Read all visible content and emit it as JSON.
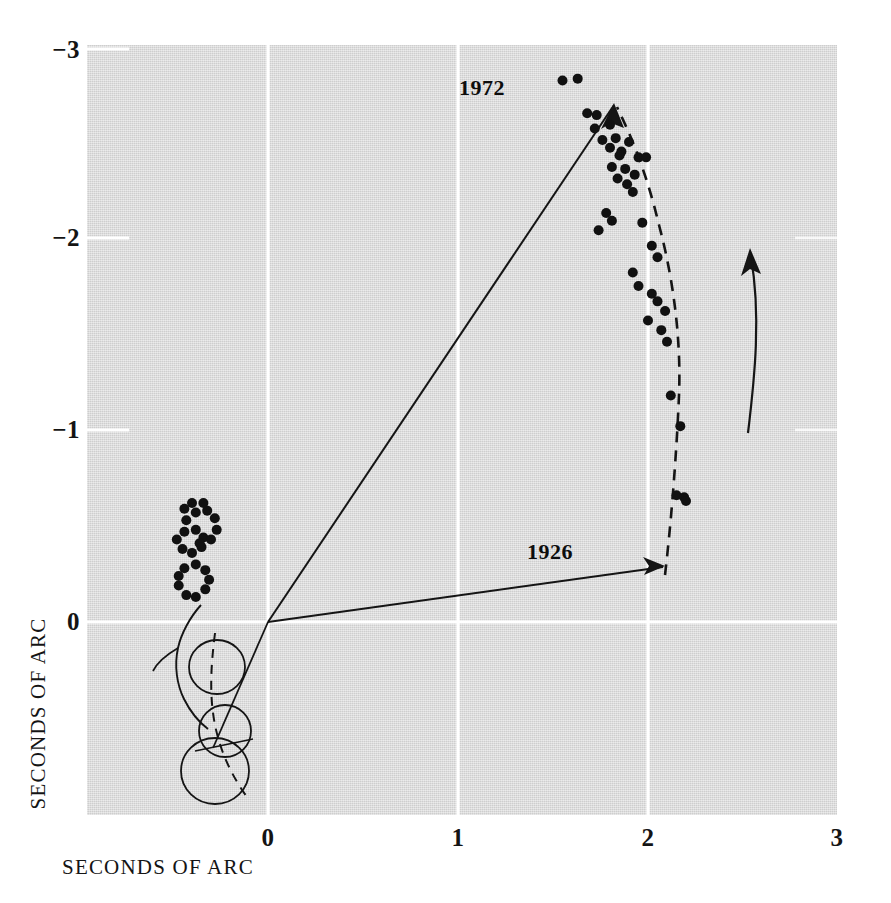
{
  "figure": {
    "background_color": "#ffffff",
    "panel_color": "#d9d9d9",
    "ink_color": "#111111",
    "gridline_color": "#ffffff"
  },
  "axes": {
    "x_title": "SECONDS OF ARC",
    "y_title": "SECONDS OF ARC",
    "x_ticks": [
      {
        "label": "0",
        "value": 0
      },
      {
        "label": "1",
        "value": 1
      },
      {
        "label": "2",
        "value": 2
      },
      {
        "label": "3",
        "value": 3
      }
    ],
    "y_ticks": [
      {
        "label": "−3",
        "value": -3
      },
      {
        "label": "−2",
        "value": -2
      },
      {
        "label": "−1",
        "value": -1
      },
      {
        "label": "0",
        "value": 0
      }
    ],
    "xlim": [
      -0.97,
      3.0
    ],
    "ylim": [
      -3.0,
      1.01
    ],
    "grid": true
  },
  "annotations": [
    {
      "name": "year-1972",
      "text": "1972",
      "x": 1.37,
      "y": -2.83
    },
    {
      "name": "year-1926",
      "text": "1926",
      "x": 1.73,
      "y": -0.33
    }
  ],
  "chart_data": {
    "type": "scatter",
    "title": "",
    "xlabel": "SECONDS OF ARC",
    "ylabel": "SECONDS OF ARC",
    "xlim": [
      -0.97,
      3.0
    ],
    "ylim": [
      -3.0,
      1.01
    ],
    "grid": true,
    "legend": "none",
    "series": [
      {
        "name": "observed positions (outer arc)",
        "marker": "filled-circle",
        "color": "#111111",
        "points": [
          [
            1.55,
            -2.82
          ],
          [
            1.63,
            -2.83
          ],
          [
            1.68,
            -2.65
          ],
          [
            1.73,
            -2.64
          ],
          [
            1.8,
            -2.59
          ],
          [
            1.72,
            -2.57
          ],
          [
            1.83,
            -2.52
          ],
          [
            1.76,
            -2.51
          ],
          [
            1.9,
            -2.5
          ],
          [
            1.86,
            -2.45
          ],
          [
            1.8,
            -2.47
          ],
          [
            1.85,
            -2.43
          ],
          [
            1.95,
            -2.42
          ],
          [
            1.99,
            -2.42
          ],
          [
            1.81,
            -2.37
          ],
          [
            1.88,
            -2.36
          ],
          [
            1.84,
            -2.31
          ],
          [
            1.89,
            -2.28
          ],
          [
            1.93,
            -2.33
          ],
          [
            1.92,
            -2.24
          ],
          [
            1.78,
            -2.13
          ],
          [
            1.81,
            -2.09
          ],
          [
            1.74,
            -2.04
          ],
          [
            1.97,
            -2.08
          ],
          [
            2.02,
            -1.96
          ],
          [
            2.05,
            -1.9
          ],
          [
            1.92,
            -1.82
          ],
          [
            1.95,
            -1.75
          ],
          [
            2.02,
            -1.71
          ],
          [
            2.05,
            -1.67
          ],
          [
            2.09,
            -1.62
          ],
          [
            2.0,
            -1.57
          ],
          [
            2.07,
            -1.52
          ],
          [
            2.1,
            -1.46
          ],
          [
            2.12,
            -1.18
          ],
          [
            2.17,
            -1.02
          ],
          [
            2.15,
            -0.66
          ],
          [
            2.19,
            -0.65
          ],
          [
            2.2,
            -0.63
          ]
        ]
      },
      {
        "name": "observed positions (inner loops)",
        "marker": "filled-circle",
        "color": "#111111",
        "points": [
          [
            -0.47,
            -0.19
          ],
          [
            -0.43,
            -0.14
          ],
          [
            -0.38,
            -0.13
          ],
          [
            -0.33,
            -0.17
          ],
          [
            -0.31,
            -0.22
          ],
          [
            -0.33,
            -0.27
          ],
          [
            -0.38,
            -0.3
          ],
          [
            -0.44,
            -0.28
          ],
          [
            -0.47,
            -0.24
          ],
          [
            -0.45,
            -0.38
          ],
          [
            -0.4,
            -0.36
          ],
          [
            -0.35,
            -0.39
          ],
          [
            -0.34,
            -0.44
          ],
          [
            -0.38,
            -0.48
          ],
          [
            -0.44,
            -0.47
          ],
          [
            -0.48,
            -0.43
          ],
          [
            -0.43,
            -0.53
          ],
          [
            -0.38,
            -0.57
          ],
          [
            -0.32,
            -0.58
          ],
          [
            -0.28,
            -0.54
          ],
          [
            -0.27,
            -0.48
          ],
          [
            -0.3,
            -0.43
          ],
          [
            -0.36,
            -0.41
          ],
          [
            -0.44,
            -0.59
          ],
          [
            -0.4,
            -0.62
          ],
          [
            -0.34,
            -0.62
          ]
        ]
      }
    ],
    "curves": [
      {
        "name": "fitted-orbit-dashed-outer",
        "style": "dashed"
      },
      {
        "name": "fitted-orbit-solid-inner",
        "style": "solid"
      },
      {
        "name": "radius-vector-1972",
        "style": "solid-arrow"
      },
      {
        "name": "radius-vector-1926",
        "style": "solid-arrow"
      },
      {
        "name": "direction-of-motion-arrow",
        "style": "solid-arrow"
      }
    ]
  }
}
